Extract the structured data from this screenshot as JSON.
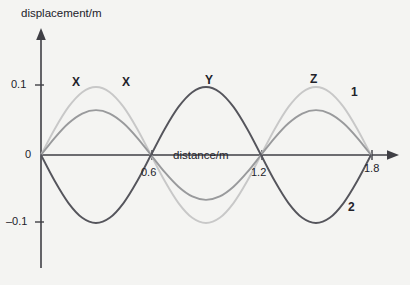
{
  "figure": {
    "background_color": "#f4f4f2",
    "axis_color": "#3f3f45",
    "y_axis_title": "displacement/m",
    "x_axis_title": "distance/m"
  },
  "y_ticks": [
    {
      "label": "0.1",
      "value": 0.1
    },
    {
      "label": "0",
      "value": 0
    },
    {
      "label": "–0.1",
      "value": -0.1
    }
  ],
  "x_ticks": [
    {
      "label": "0.6",
      "value": 0.6
    },
    {
      "label": "1.2",
      "value": 1.2
    },
    {
      "label": "1.8",
      "value": 1.8
    }
  ],
  "curve_labels": [
    {
      "text": "X",
      "x": 72,
      "y": 76
    },
    {
      "text": "X",
      "x": 122,
      "y": 76
    },
    {
      "text": "Y",
      "x": 205,
      "y": 74
    },
    {
      "text": "Z",
      "x": 310,
      "y": 73
    },
    {
      "text": "1",
      "x": 351,
      "y": 86
    },
    {
      "text": "2",
      "x": 348,
      "y": 201
    }
  ],
  "chart_data": {
    "type": "line",
    "title": "",
    "xlabel": "distance/m",
    "ylabel": "displacement/m",
    "xlim": [
      0,
      1.95
    ],
    "ylim": [
      -0.135,
      0.135
    ],
    "grid": false,
    "legend": "none",
    "x_tick_values": [
      0.6,
      1.2,
      1.8
    ],
    "y_tick_values": [
      0.1,
      0,
      -0.1
    ],
    "nodes": [
      0.0,
      0.6,
      1.2,
      1.8
    ],
    "wavelength": 1.2,
    "annotations": [
      "X",
      "X",
      "Y",
      "Z",
      "1",
      "2"
    ],
    "series": [
      {
        "name": "wave-1",
        "label": "1",
        "color": "#c8c8c8",
        "amplitude": 0.1,
        "phase": "positive",
        "point_labels": [
          "X",
          "X",
          "Z",
          "1"
        ],
        "x": [
          0,
          0.075,
          0.15,
          0.225,
          0.3,
          0.375,
          0.45,
          0.525,
          0.6,
          0.675,
          0.75,
          0.825,
          0.9,
          0.975,
          1.05,
          1.125,
          1.2,
          1.275,
          1.35,
          1.425,
          1.5,
          1.575,
          1.65,
          1.725,
          1.8
        ],
        "y": [
          0,
          0.0383,
          0.0707,
          0.0924,
          0.1,
          0.0924,
          0.0707,
          0.0383,
          0,
          -0.0383,
          -0.0707,
          -0.0924,
          -0.1,
          -0.0924,
          -0.0707,
          -0.0383,
          0,
          0.0383,
          0.0707,
          0.0924,
          0.1,
          0.0924,
          0.0707,
          0.0383,
          0
        ]
      },
      {
        "name": "wave-resultant",
        "label": "",
        "color": "#999a9c",
        "amplitude": 0.066,
        "phase": "positive",
        "point_labels": [],
        "x": [
          0,
          0.075,
          0.15,
          0.225,
          0.3,
          0.375,
          0.45,
          0.525,
          0.6,
          0.675,
          0.75,
          0.825,
          0.9,
          0.975,
          1.05,
          1.125,
          1.2,
          1.275,
          1.35,
          1.425,
          1.5,
          1.575,
          1.65,
          1.725,
          1.8
        ],
        "y": [
          0,
          0.0253,
          0.0467,
          0.061,
          0.066,
          0.061,
          0.0467,
          0.0253,
          0,
          -0.0253,
          -0.0467,
          -0.061,
          -0.066,
          -0.061,
          -0.0467,
          -0.0253,
          0,
          0.0253,
          0.0467,
          0.061,
          0.066,
          0.061,
          0.0467,
          0.0253,
          0
        ]
      },
      {
        "name": "wave-2",
        "label": "2",
        "color": "#55555c",
        "amplitude": 0.1,
        "phase": "inverted",
        "point_labels": [
          "Y",
          "2"
        ],
        "x": [
          0,
          0.075,
          0.15,
          0.225,
          0.3,
          0.375,
          0.45,
          0.525,
          0.6,
          0.675,
          0.75,
          0.825,
          0.9,
          0.975,
          1.05,
          1.125,
          1.2,
          1.275,
          1.35,
          1.425,
          1.5,
          1.575,
          1.65,
          1.725,
          1.8
        ],
        "y": [
          0,
          -0.0383,
          -0.0707,
          -0.0924,
          -0.1,
          -0.0924,
          -0.0707,
          -0.0383,
          0,
          0.0383,
          0.0707,
          0.0924,
          0.1,
          0.0924,
          0.0707,
          0.0383,
          0,
          -0.0383,
          -0.0707,
          -0.0924,
          -0.1,
          -0.0924,
          -0.0707,
          -0.0383,
          0
        ]
      }
    ]
  }
}
